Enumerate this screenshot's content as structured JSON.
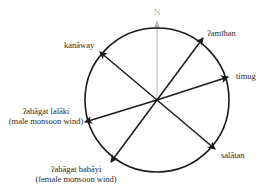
{
  "diagram": {
    "type": "wind-compass",
    "north_label": "N",
    "center": [
      157,
      100
    ],
    "radius": 72,
    "colors": {
      "circle": "#1a1a1a",
      "arrows": "#1a1a1a",
      "north_line": "#b8b8b8",
      "text": "#2a2a2a"
    },
    "winds": [
      {
        "id": "kanaway",
        "label": "kanāway",
        "sublabel": "",
        "tip": [
          100,
          52
        ]
      },
      {
        "id": "amihan",
        "label": "ʔamīhan",
        "sublabel": "",
        "tip": [
          203,
          38
        ]
      },
      {
        "id": "timug",
        "label": "timug",
        "sublabel": "",
        "tip": [
          228,
          77
        ]
      },
      {
        "id": "abagat-lalaki",
        "label": "ʔabāgat lalāki",
        "sublabel": "(male monsoon wind)",
        "tip": [
          85,
          122
        ]
      },
      {
        "id": "abagat-babayi",
        "label": "ʔabāgat babāyi",
        "sublabel": "(female monsoon wind)",
        "tip": [
          111,
          162
        ]
      },
      {
        "id": "salatan",
        "label": "salātan",
        "sublabel": "",
        "tip": [
          215,
          149
        ]
      }
    ]
  }
}
